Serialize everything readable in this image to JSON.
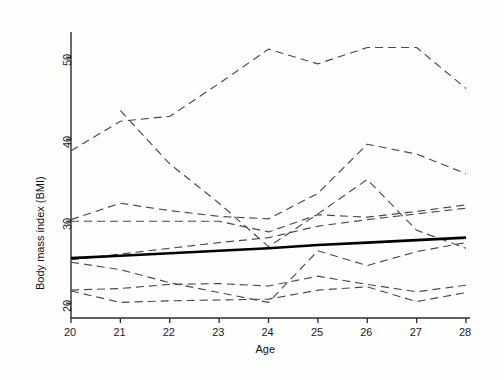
{
  "chart_data": {
    "type": "line",
    "title": "",
    "xlabel": "Age",
    "ylabel": "Body mass index (BMI)",
    "xlim": [
      20,
      28
    ],
    "ylim": [
      18.2,
      52.6
    ],
    "xticks": [
      20,
      21,
      22,
      23,
      24,
      25,
      26,
      27,
      28
    ],
    "xticklabels": [
      "20",
      "21",
      "22",
      "23",
      "24",
      "25",
      "26",
      "27",
      "28"
    ],
    "yticks": [
      20,
      30,
      40,
      50
    ],
    "yticklabels": [
      "20",
      "30",
      "40",
      "50"
    ],
    "grid": false,
    "legend": "none",
    "x": [
      20,
      21,
      22,
      23,
      24,
      25,
      26,
      27,
      28
    ],
    "series": [
      {
        "name": "subject-1",
        "style": "dashed",
        "values": [
          38.6,
          42.2,
          42.8,
          46.8,
          51.0,
          49.2,
          51.2,
          51.2,
          46.2
        ]
      },
      {
        "name": "subject-2",
        "style": "dashed",
        "values": [
          null,
          43.5,
          37.0,
          32.2,
          26.9,
          30.9,
          35.1,
          28.9,
          26.7
        ]
      },
      {
        "name": "subject-3",
        "style": "dashed",
        "values": [
          30.2,
          32.2,
          31.3,
          30.6,
          30.3,
          33.4,
          39.4,
          38.2,
          35.8
        ]
      },
      {
        "name": "subject-4",
        "style": "dashed",
        "values": [
          30.0,
          30.0,
          30.0,
          30.0,
          28.7,
          30.8,
          30.5,
          31.2,
          32.0
        ]
      },
      {
        "name": "subject-5",
        "style": "dashed",
        "values": [
          25.3,
          26.0,
          26.7,
          27.4,
          28.0,
          29.4,
          30.2,
          30.9,
          31.6
        ]
      },
      {
        "name": "subject-6",
        "style": "dashed",
        "values": [
          25.0,
          24.1,
          22.5,
          21.3,
          20.1,
          26.4,
          24.6,
          26.3,
          27.4
        ]
      },
      {
        "name": "subject-7",
        "style": "dashed",
        "values": [
          21.6,
          21.8,
          22.3,
          22.4,
          22.1,
          23.3,
          22.3,
          21.4,
          22.2
        ]
      },
      {
        "name": "subject-8",
        "style": "dashed",
        "values": [
          21.5,
          20.1,
          20.3,
          20.4,
          20.5,
          21.6,
          22.0,
          20.2,
          21.3
        ]
      },
      {
        "name": "population-mean-fit",
        "style": "solid-bold",
        "values": [
          25.5,
          25.8,
          26.1,
          26.4,
          26.7,
          27.1,
          27.4,
          27.7,
          28.0
        ]
      }
    ],
    "annotations": []
  },
  "axis": {
    "x_title": "Age",
    "y_title": "Body mass index (BMI)"
  },
  "colors": {
    "axis": "#2b2b2b",
    "dashed_line": "#4a4a4a",
    "bold_line": "#000000",
    "background": "#ffffff",
    "text": "#111111"
  }
}
